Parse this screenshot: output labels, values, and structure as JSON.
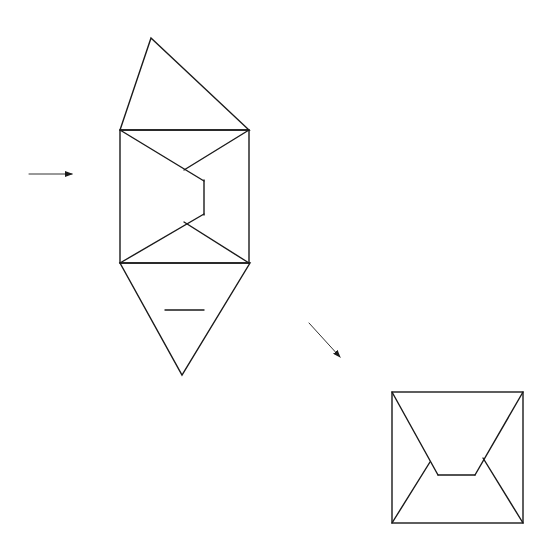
{
  "diagram": {
    "stroke_color": "#1a1a1a",
    "background": "#ffffff",
    "figures": [
      {
        "id": "net",
        "top_triangle": [
          [
            151,
            38
          ],
          [
            120,
            130
          ],
          [
            249,
            130
          ]
        ],
        "square": [
          [
            120,
            130
          ],
          [
            249,
            130
          ],
          [
            249,
            263
          ],
          [
            120,
            263
          ]
        ],
        "inner_lines": [
          [
            [
              120,
              130
            ],
            [
              204,
              181
            ]
          ],
          [
            [
              249,
              130
            ],
            [
              184,
              170
            ]
          ],
          [
            [
              204,
              180
            ],
            [
              204,
              215
            ]
          ],
          [
            [
              120,
              263
            ],
            [
              204,
              214
            ]
          ],
          [
            [
              249,
              263
            ],
            [
              184,
              222
            ]
          ]
        ],
        "bottom_triangle": [
          [
            120,
            263
          ],
          [
            250,
            263
          ],
          [
            182,
            375
          ]
        ],
        "bottom_mark": [
          [
            165,
            310
          ],
          [
            204,
            310
          ]
        ]
      },
      {
        "id": "folded-view",
        "square": [
          [
            392,
            392
          ],
          [
            523,
            392
          ],
          [
            523,
            523
          ],
          [
            392,
            523
          ]
        ],
        "inner_lines": [
          [
            [
              392,
              392
            ],
            [
              438,
              475
            ]
          ],
          [
            [
              438,
              475
            ],
            [
              475,
              475
            ]
          ],
          [
            [
              523,
              392
            ],
            [
              475,
              475
            ]
          ],
          [
            [
              392,
              523
            ],
            [
              430,
              462
            ]
          ],
          [
            [
              523,
              523
            ],
            [
              483,
              458
            ]
          ]
        ]
      }
    ],
    "arrows": [
      {
        "id": "arrow-right",
        "from": [
          29,
          174
        ],
        "to": [
          72,
          174
        ]
      },
      {
        "id": "arrow-diagonal",
        "from": [
          309,
          323
        ],
        "to": [
          340,
          357
        ]
      }
    ]
  }
}
